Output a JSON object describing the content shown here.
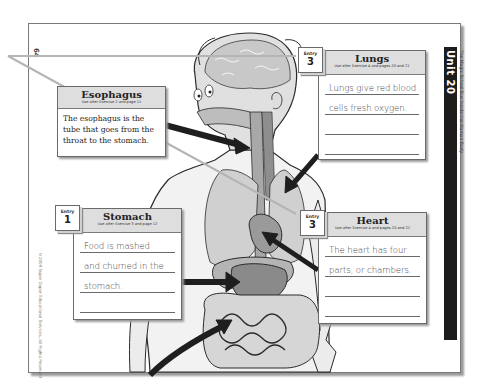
{
  "page": {
    "page_number": "64",
    "unit_label": "Unit 20",
    "unit_subtitle": "The Magic School Bus Inside the Human Body",
    "copyright": "©2009 Super Duper Educational Services, All Rights Reserved"
  },
  "cards": {
    "esophagus": {
      "title": "Esophagus",
      "subtitle": "Use after Exercise 2 and page 11",
      "text": "The esophagus is the tube that goes from the throat to the stomach."
    },
    "lungs": {
      "entry_word": "Entry",
      "entry_number": "3",
      "title": "Lungs",
      "subtitle": "Use after Exercise 4 and pages 20 and 21",
      "lines": [
        "Lungs give red blood",
        "cells fresh oxygen.",
        "",
        ""
      ]
    },
    "stomach": {
      "entry_word": "Entry",
      "entry_number": "1",
      "title": "Stomach",
      "subtitle": "Use after Exercise 3 and page 12",
      "lines": [
        "Food is mashed",
        "and churned in the",
        "stomach.",
        ""
      ]
    },
    "heart": {
      "entry_word": "Entry",
      "entry_number": "3",
      "title": "Heart",
      "subtitle": "Use after Exercise 4 and pages 20 and 21",
      "lines": [
        "The heart has four",
        "parts, or chambers.",
        "",
        ""
      ]
    }
  },
  "illustration": {
    "subject": "human-body-digestive-and-respiratory-system",
    "colors": {
      "outline": "#2a2a2a",
      "organ_fill": "#9a9a9a",
      "skin_fill": "#e2e2e2",
      "arrow": "#1e1e1e",
      "pointer_line": "#b5b5b5",
      "unit_bar": "#1d1d1d"
    }
  }
}
